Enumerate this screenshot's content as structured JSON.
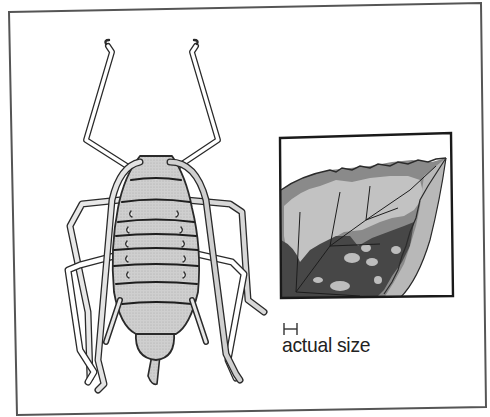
{
  "figure": {
    "inset": {
      "subject": "damaged leaf detail"
    },
    "scale_bar": {
      "icon": "scale-bar-icon",
      "label": "actual size"
    }
  },
  "colors": {
    "frame": "#555555",
    "outline": "#222222",
    "body_fill": "#c8c8c8",
    "leg_fill": "#d6d6d6",
    "leaf_dark": "#4a4a4a",
    "leaf_mid": "#7a7a7a",
    "leaf_light": "#c4c4c4",
    "background": "#ffffff"
  }
}
